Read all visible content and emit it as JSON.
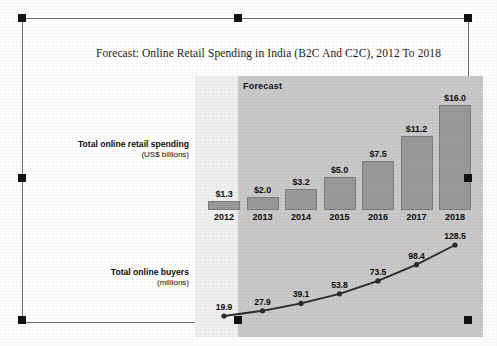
{
  "chart_data": {
    "type": "bar",
    "title": "Forecast: Online Retail Spending in India (B2C And C2C), 2012 To 2018",
    "categories": [
      "2012",
      "2013",
      "2014",
      "2015",
      "2016",
      "2017",
      "2018"
    ],
    "xlabel": "",
    "grid": false,
    "legend_position": "none",
    "annotations": [
      "Forecast"
    ],
    "series": [
      {
        "name": "Total online retail spending (US$ billions)",
        "type": "bar",
        "unit": "US$ billions",
        "values": [
          1.3,
          2.0,
          3.2,
          5.0,
          7.5,
          11.2,
          16.0
        ],
        "labels": [
          "$1.3",
          "$2.0",
          "$3.2",
          "$5.0",
          "$7.5",
          "$11.2",
          "$16.0"
        ],
        "ylim": [
          0,
          16.0
        ],
        "color": "#9a9a9a"
      },
      {
        "name": "Total online buyers (millions)",
        "type": "line",
        "unit": "millions",
        "values": [
          19.9,
          27.9,
          39.1,
          53.8,
          73.5,
          98.4,
          128.5
        ],
        "labels": [
          "19.9",
          "27.9",
          "39.1",
          "53.8",
          "73.5",
          "98.4",
          "128.5"
        ],
        "ylim": [
          0,
          128.5
        ],
        "color": "#2b2b2b"
      }
    ]
  },
  "labels": {
    "spending_title": "Total online retail spending",
    "spending_unit": "(US$ billions)",
    "buyers_title": "Total online buyers",
    "buyers_unit": "(millions)",
    "forecast_band": "Forecast"
  },
  "colors": {
    "bar_fill": "#9a9a9a",
    "forecast_band": "#c9c9c9",
    "plot_background": "#f0f0f0",
    "line": "#2b2b2b",
    "frame_border": "#6e6e6e",
    "handle": "#111111"
  }
}
